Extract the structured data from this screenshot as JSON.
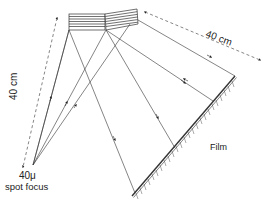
{
  "diagram": {
    "labels": {
      "distance_top": "40 cm",
      "distance_left": "40 cm",
      "focus_size": "40μ",
      "focus_desc": "spot focus",
      "film": "Film"
    },
    "components": {
      "source": {
        "name": "spot focus",
        "x": 33,
        "y": 165
      },
      "crystal": {
        "name": "crystal block (two segments)",
        "segments": 2
      },
      "film": {
        "name": "film",
        "from": [
          132,
          195
        ],
        "to": [
          235,
          77
        ]
      }
    },
    "colors": {
      "line": "#333333",
      "background": "#ffffff"
    }
  }
}
